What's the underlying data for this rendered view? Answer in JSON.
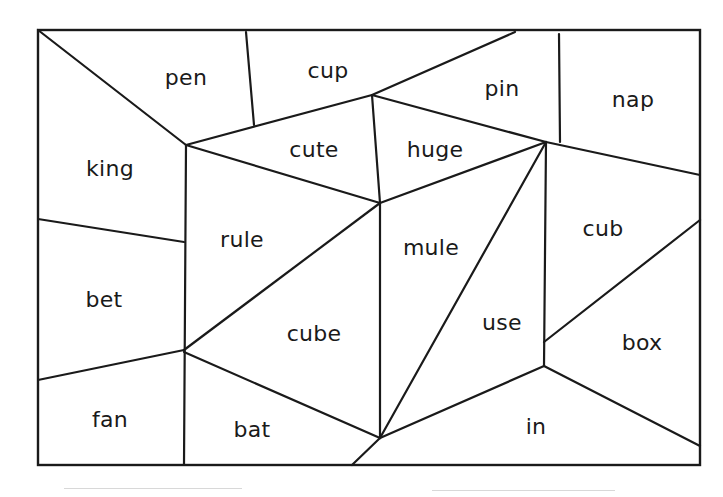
{
  "diagram": {
    "type": "word-puzzle-regions",
    "frame": {
      "x1": 38,
      "y1": 30,
      "x2": 700,
      "y2": 465
    },
    "line_color": "#1a1a1a",
    "words": [
      {
        "id": "pen",
        "text": "pen",
        "x": 186,
        "y": 77
      },
      {
        "id": "cup",
        "text": "cup",
        "x": 328,
        "y": 70
      },
      {
        "id": "pin",
        "text": "pin",
        "x": 502,
        "y": 88
      },
      {
        "id": "nap",
        "text": "nap",
        "x": 633,
        "y": 99
      },
      {
        "id": "king",
        "text": "king",
        "x": 110,
        "y": 168
      },
      {
        "id": "cute",
        "text": "cute",
        "x": 314,
        "y": 149
      },
      {
        "id": "huge",
        "text": "huge",
        "x": 435,
        "y": 149
      },
      {
        "id": "rule",
        "text": "rule",
        "x": 242,
        "y": 239
      },
      {
        "id": "mule",
        "text": "mule",
        "x": 431,
        "y": 247
      },
      {
        "id": "cub",
        "text": "cub",
        "x": 603,
        "y": 228
      },
      {
        "id": "bet",
        "text": "bet",
        "x": 104,
        "y": 299
      },
      {
        "id": "cube",
        "text": "cube",
        "x": 314,
        "y": 333
      },
      {
        "id": "use",
        "text": "use",
        "x": 502,
        "y": 322
      },
      {
        "id": "box",
        "text": "box",
        "x": 642,
        "y": 342
      },
      {
        "id": "fan",
        "text": "fan",
        "x": 110,
        "y": 419
      },
      {
        "id": "bat",
        "text": "bat",
        "x": 252,
        "y": 429
      },
      {
        "id": "in",
        "text": "in",
        "x": 536,
        "y": 426
      }
    ],
    "segments": [
      [
        38,
        30,
        186,
        145
      ],
      [
        246,
        32,
        254,
        125
      ],
      [
        186,
        145,
        372,
        95
      ],
      [
        372,
        95,
        515,
        32
      ],
      [
        559,
        34,
        560,
        142
      ],
      [
        372,
        95,
        546,
        142
      ],
      [
        546,
        142,
        700,
        175
      ],
      [
        186,
        145,
        380,
        203
      ],
      [
        372,
        95,
        380,
        203
      ],
      [
        380,
        203,
        546,
        142
      ],
      [
        186,
        145,
        184,
        465
      ],
      [
        38,
        219,
        184,
        242
      ],
      [
        184,
        350,
        380,
        203
      ],
      [
        380,
        203,
        380,
        438
      ],
      [
        380,
        438,
        546,
        142
      ],
      [
        546,
        142,
        544,
        366
      ],
      [
        544,
        342,
        700,
        220
      ],
      [
        38,
        380,
        184,
        350
      ],
      [
        184,
        352,
        380,
        438
      ],
      [
        380,
        438,
        544,
        366
      ],
      [
        544,
        366,
        700,
        446
      ],
      [
        380,
        438,
        352,
        465
      ]
    ],
    "faint_lines": [
      {
        "x": 64,
        "y": 488,
        "w": 178
      },
      {
        "x": 432,
        "y": 490,
        "w": 183
      }
    ]
  }
}
